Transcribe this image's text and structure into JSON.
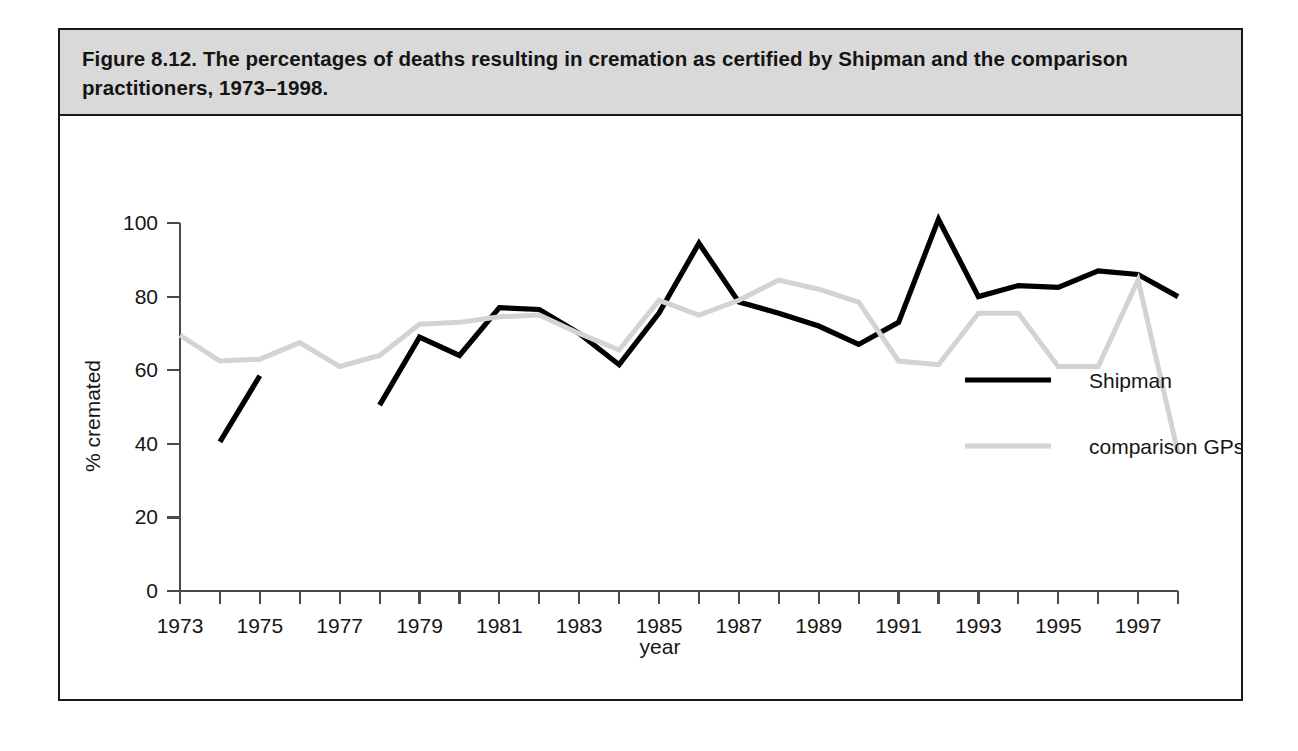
{
  "figure": {
    "caption": "Figure 8.12. The percentages of deaths resulting in cremation as certified by Shipman and the comparison practitioners, 1973–1998."
  },
  "chart_data": {
    "type": "line",
    "title": "Figure 8.12. The percentages of deaths resulting in cremation as certified by Shipman and the comparison practitioners, 1973–1998.",
    "xlabel": "year",
    "ylabel": "% cremated",
    "xlim": [
      1973,
      1998
    ],
    "ylim": [
      0,
      100
    ],
    "grid": false,
    "legend_position": "inside-right",
    "x_ticks": [
      1973,
      1974,
      1975,
      1976,
      1977,
      1978,
      1979,
      1980,
      1981,
      1982,
      1983,
      1984,
      1985,
      1986,
      1987,
      1988,
      1989,
      1990,
      1991,
      1992,
      1993,
      1994,
      1995,
      1996,
      1997,
      1998
    ],
    "x_tick_labels": [
      "1973",
      "",
      "1975",
      "",
      "1977",
      "",
      "1979",
      "",
      "1981",
      "",
      "1983",
      "",
      "1985",
      "",
      "1987",
      "",
      "1989",
      "",
      "1991",
      "",
      "1993",
      "",
      "1995",
      "",
      "1997",
      ""
    ],
    "y_ticks": [
      0,
      20,
      40,
      60,
      80,
      100
    ],
    "y_tick_labels": [
      "0",
      "20",
      "40",
      "60",
      "80",
      "100"
    ],
    "series": [
      {
        "name": "Shipman",
        "color": "#000000",
        "x": [
          1974,
          1975,
          null,
          1978,
          1979,
          1980,
          1981,
          1982,
          1983,
          1984,
          1985,
          1986,
          1987,
          1988,
          1989,
          1990,
          1991,
          1992,
          1993,
          1994,
          1995,
          1996,
          1997,
          1998
        ],
        "values": [
          40.5,
          58.5,
          null,
          50.5,
          69.0,
          64.0,
          77.0,
          76.5,
          70.0,
          61.5,
          75.5,
          94.5,
          78.5,
          75.5,
          72.0,
          67.0,
          73.0,
          101.0,
          80.0,
          83.0,
          82.5,
          87.0,
          86.0,
          80.0
        ]
      },
      {
        "name": "comparison GPs",
        "color": "#d3d3d3",
        "x": [
          1973,
          1974,
          1975,
          1976,
          1977,
          1978,
          1979,
          1980,
          1981,
          1982,
          1983,
          1984,
          1985,
          1986,
          1987,
          1988,
          1989,
          1990,
          1991,
          1992,
          1993,
          1994,
          1995,
          1996,
          1997,
          1998
        ],
        "values": [
          69.5,
          62.5,
          63.0,
          67.5,
          61.0,
          64.0,
          72.5,
          73.0,
          74.5,
          75.0,
          70.0,
          65.5,
          79.0,
          75.0,
          79.0,
          84.5,
          82.0,
          78.5,
          62.5,
          61.5,
          75.5,
          75.5,
          61.0,
          61.0,
          84.5,
          37.5
        ]
      }
    ],
    "legend": [
      {
        "label": "Shipman",
        "color": "#000000"
      },
      {
        "label": "comparison GPs",
        "color": "#d3d3d3"
      }
    ]
  }
}
